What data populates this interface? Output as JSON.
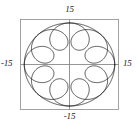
{
  "figure": {
    "title": "",
    "background_color": "#ffffff",
    "frame_color": "#8a8a8a",
    "axis_color": "#8a8a8a",
    "curve_color": "#1a1a1a"
  },
  "labels": {
    "top": "15",
    "bottom": "-15",
    "left": "-15",
    "right": "15"
  },
  "chart_data": {
    "type": "line",
    "title": "",
    "xlabel": "",
    "ylabel": "",
    "xlim": [
      -15,
      15
    ],
    "ylim": [
      -15,
      15
    ],
    "grid": false,
    "legend": false,
    "axes": "centered cross through origin",
    "frame": "square box border",
    "tick_labels": {
      "x": [
        "-15",
        "15"
      ],
      "y": [
        "-15",
        "15"
      ]
    },
    "series": [
      {
        "name": "spirograph",
        "parametric": true,
        "equation_x": "R*cos(t) + d*cos(k*t)",
        "equation_y": "R*sin(t) + d*sin(k*t)",
        "params": {
          "R": 9.5,
          "d": 4.2,
          "k": 9,
          "t_start": 0,
          "t_end": 6.283185307,
          "samples": 1400
        },
        "loops": 9,
        "outer_radius": 13.7,
        "inner_radius": 5.3
      },
      {
        "name": "outer-envelope-circle",
        "parametric": true,
        "equation_x": "r*cos(t)",
        "equation_y": "r*sin(t)",
        "params": {
          "r": 13.7,
          "t_start": 0,
          "t_end": 6.283185307,
          "samples": 600
        }
      }
    ]
  },
  "geometry": {
    "frame": {
      "left": 20,
      "top": 19,
      "right": 119,
      "bottom": 110
    },
    "origin": {
      "x": 69.5,
      "y": 64.5
    },
    "scale_px_per_unit_x": 3.3,
    "scale_px_per_unit_y": 3.03
  }
}
